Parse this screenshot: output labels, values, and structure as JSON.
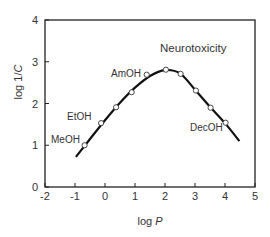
{
  "chart_data": {
    "type": "line",
    "title": "",
    "annotation": "Neurotoxicity",
    "xlabel": "log P",
    "ylabel": "log 1/C",
    "xlim": [
      -2,
      5
    ],
    "ylim": [
      0,
      4
    ],
    "xticks": [
      -2,
      -1,
      0,
      1,
      2,
      3,
      4,
      5
    ],
    "yticks": [
      0,
      1,
      2,
      3,
      4
    ],
    "grid": false,
    "legend": "none",
    "series": [
      {
        "name": "fitted curve",
        "style": "line",
        "x": [
          -0.97,
          -0.5,
          0.0,
          0.5,
          1.0,
          1.5,
          2.0,
          2.5,
          3.0,
          3.5,
          4.0,
          4.48
        ],
        "y": [
          0.72,
          1.15,
          1.6,
          2.02,
          2.38,
          2.66,
          2.8,
          2.72,
          2.33,
          1.92,
          1.53,
          1.1
        ]
      },
      {
        "name": "alcohols",
        "style": "open-circle markers",
        "x": [
          -0.68,
          -0.13,
          0.37,
          0.89,
          1.39,
          2.03,
          2.52,
          3.03,
          3.52,
          4.02
        ],
        "y": [
          1.0,
          1.53,
          1.91,
          2.27,
          2.69,
          2.81,
          2.71,
          2.31,
          1.9,
          1.54
        ]
      }
    ],
    "point_labels": [
      {
        "text": "MeOH",
        "x": -0.68,
        "y": 1.0
      },
      {
        "text": "EtOH",
        "x": -0.13,
        "y": 1.53
      },
      {
        "text": "AmOH",
        "x": 1.39,
        "y": 2.69
      },
      {
        "text": "DecOH",
        "x": 4.02,
        "y": 1.54
      }
    ]
  },
  "labels": {
    "xlabel_main": "log ",
    "xlabel_italic": "P",
    "ylabel_main": "log 1/",
    "ylabel_italic": "C",
    "annotation": "Neurotoxicity",
    "meoh": "MeOH",
    "etoh": "EtOH",
    "amoh": "AmOH",
    "decoh": "DecOH"
  }
}
